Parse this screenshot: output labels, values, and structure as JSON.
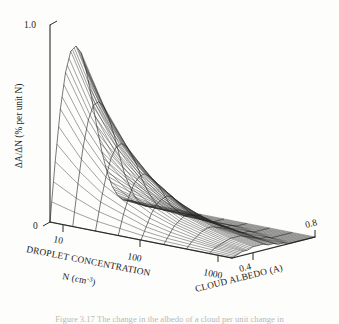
{
  "figure": {
    "kind": "3d-surface-wireframe",
    "background_color": "#fdfdfb",
    "line_color": "#2b2b2b"
  },
  "axes": {
    "vertical": {
      "label": "ΔA/ΔN  (% per unit N)",
      "ticks": [
        "0",
        "1.0"
      ],
      "tick_values": [
        0,
        1.0
      ],
      "range": [
        0,
        1.0
      ]
    },
    "depth": {
      "label_line1": "DROPLET CONCENTRATION",
      "label_line2": "N (cm",
      "label_exponent": "-3",
      "label_line2_end": ")",
      "ticks": [
        "10",
        "100",
        "1000"
      ],
      "tick_values": [
        10,
        100,
        1000
      ],
      "scale": "log"
    },
    "horizontal": {
      "label": "CLOUD ALBEDO (A)",
      "ticks": [
        "0.4",
        "0.8"
      ],
      "tick_values": [
        0.4,
        0.8
      ],
      "range": [
        0.0,
        0.8
      ]
    }
  },
  "caption": {
    "text": "Figure 3.17  The change in the albedo of a cloud per unit change in"
  },
  "chart_data": {
    "type": "surface",
    "title": "",
    "xlabel": "CLOUD ALBEDO (A)",
    "ylabel": "DROPLET CONCENTRATION N (cm-3)",
    "zlabel": "ΔA/ΔN (% per unit N)",
    "xlim": [
      0.0,
      0.8
    ],
    "ylim": [
      10,
      1000
    ],
    "zlim": [
      0,
      1.0
    ],
    "y_scale": "log",
    "grid": false,
    "legend": false,
    "x": [
      0.0,
      0.05,
      0.1,
      0.15,
      0.2,
      0.25,
      0.3,
      0.35,
      0.4,
      0.45,
      0.5,
      0.55,
      0.6,
      0.65,
      0.7,
      0.75,
      0.8
    ],
    "y": [
      10,
      18,
      32,
      56,
      100,
      178,
      316,
      562,
      1000
    ],
    "z": [
      [
        0.0,
        0.3,
        0.56,
        0.74,
        0.84,
        0.86,
        0.82,
        0.72,
        0.58,
        0.43,
        0.29,
        0.18,
        0.1,
        0.05,
        0.02,
        0.01,
        0.0
      ],
      [
        0.0,
        0.21,
        0.39,
        0.52,
        0.59,
        0.6,
        0.57,
        0.5,
        0.41,
        0.3,
        0.2,
        0.13,
        0.07,
        0.03,
        0.01,
        0.0,
        0.0
      ],
      [
        0.0,
        0.14,
        0.26,
        0.35,
        0.4,
        0.41,
        0.39,
        0.34,
        0.28,
        0.2,
        0.14,
        0.09,
        0.05,
        0.02,
        0.01,
        0.0,
        0.0
      ],
      [
        0.0,
        0.1,
        0.18,
        0.24,
        0.27,
        0.28,
        0.26,
        0.23,
        0.19,
        0.14,
        0.09,
        0.06,
        0.03,
        0.01,
        0.01,
        0.0,
        0.0
      ],
      [
        0.0,
        0.06,
        0.12,
        0.16,
        0.18,
        0.19,
        0.18,
        0.15,
        0.12,
        0.09,
        0.06,
        0.04,
        0.02,
        0.01,
        0.0,
        0.0,
        0.0
      ],
      [
        0.0,
        0.04,
        0.08,
        0.1,
        0.12,
        0.12,
        0.11,
        0.1,
        0.08,
        0.06,
        0.04,
        0.02,
        0.01,
        0.01,
        0.0,
        0.0,
        0.0
      ],
      [
        0.0,
        0.03,
        0.05,
        0.07,
        0.08,
        0.08,
        0.07,
        0.06,
        0.05,
        0.04,
        0.02,
        0.01,
        0.01,
        0.0,
        0.0,
        0.0,
        0.0
      ],
      [
        0.0,
        0.02,
        0.03,
        0.04,
        0.05,
        0.05,
        0.05,
        0.04,
        0.03,
        0.02,
        0.01,
        0.01,
        0.0,
        0.0,
        0.0,
        0.0,
        0.0
      ],
      [
        0.0,
        0.01,
        0.02,
        0.02,
        0.03,
        0.03,
        0.03,
        0.02,
        0.02,
        0.01,
        0.01,
        0.0,
        0.0,
        0.0,
        0.0,
        0.0,
        0.0
      ]
    ],
    "projection": {
      "origin_px": [
        50,
        222
      ],
      "x_axis_end_px": [
        315,
        237
      ],
      "y_axis_end_px": [
        232,
        258
      ],
      "z_height_px": 197
    }
  }
}
